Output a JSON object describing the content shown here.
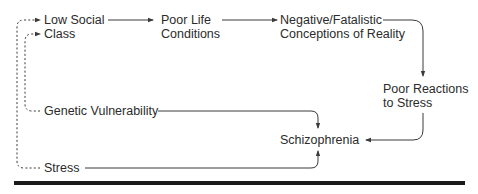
{
  "diagram": {
    "nodes": {
      "low_social_class": {
        "line1": "Low Social",
        "line2": "Class"
      },
      "poor_life_conditions": {
        "line1": "Poor Life",
        "line2": "Conditions"
      },
      "negative_conceptions": {
        "line1": "Negative/Fatalistic",
        "line2": "Conceptions of Reality"
      },
      "poor_reactions": {
        "line1": "Poor Reactions",
        "line2": "to Stress"
      },
      "genetic_vulnerability": {
        "label": "Genetic Vulnerability"
      },
      "stress": {
        "label": "Stress"
      },
      "schizophrenia": {
        "label": "Schizophrenia"
      }
    },
    "edges": [
      {
        "from": "Low Social Class",
        "to": "Poor Life Conditions",
        "style": "solid"
      },
      {
        "from": "Poor Life Conditions",
        "to": "Negative/Fatalistic Conceptions of Reality",
        "style": "solid"
      },
      {
        "from": "Negative/Fatalistic Conceptions of Reality",
        "to": "Poor Reactions to Stress",
        "style": "solid"
      },
      {
        "from": "Poor Reactions to Stress",
        "to": "Schizophrenia",
        "style": "solid"
      },
      {
        "from": "Genetic Vulnerability",
        "to": "Schizophrenia",
        "style": "solid"
      },
      {
        "from": "Stress",
        "to": "Schizophrenia",
        "style": "solid"
      },
      {
        "from": "Genetic Vulnerability",
        "to": "Low Social Class",
        "style": "dashed"
      },
      {
        "from": "Stress",
        "to": "Low Social Class",
        "style": "dashed"
      }
    ],
    "colors": {
      "line": "#3a3a3a",
      "text": "#2b2b2b",
      "rule": "#1a1a1a"
    }
  }
}
